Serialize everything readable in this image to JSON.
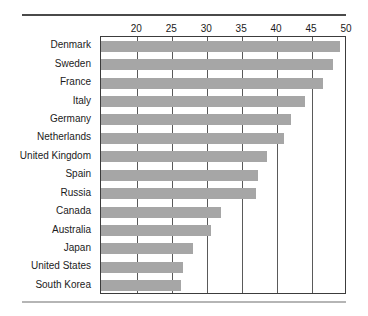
{
  "chart_data": {
    "type": "bar",
    "orientation": "horizontal",
    "title": "",
    "subtitle": "",
    "xlabel": "",
    "ylabel": "",
    "xlim": [
      14.8,
      50
    ],
    "axis_position": "top",
    "grid": true,
    "legend": null,
    "bar_color": "#a6a6a6",
    "xticks": [
      20,
      25,
      30,
      35,
      40,
      45,
      50
    ],
    "xtick_labels": [
      "20",
      "25",
      "30",
      "35",
      "40",
      "45",
      "50"
    ],
    "categories": [
      "Denmark",
      "Sweden",
      "France",
      "Italy",
      "Germany",
      "Netherlands",
      "United Kingdom",
      "Spain",
      "Russia",
      "Canada",
      "Australia",
      "Japan",
      "United States",
      "South Korea"
    ],
    "values": [
      49.0,
      48.0,
      46.5,
      44.0,
      42.0,
      41.0,
      38.5,
      37.2,
      37.0,
      32.0,
      30.5,
      28.0,
      26.5,
      26.2
    ]
  }
}
